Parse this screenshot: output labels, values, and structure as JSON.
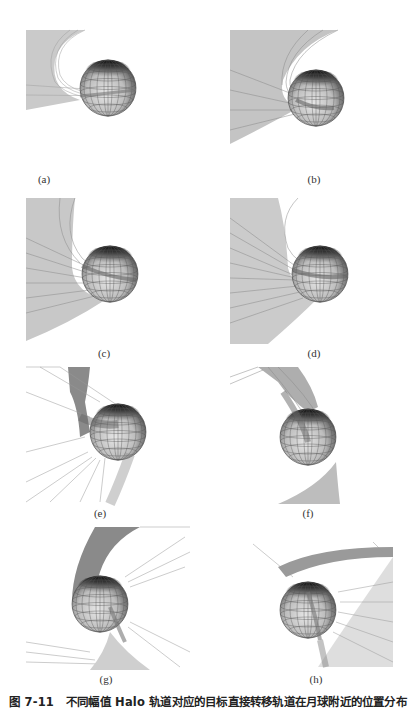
{
  "figure": {
    "number": "图 7-11",
    "title": "不同幅值 Halo 轨道对应的目标直接转移轨道在月球附近的位置分布",
    "panels": [
      {
        "id": "a",
        "label": "(a)"
      },
      {
        "id": "b",
        "label": "(b)"
      },
      {
        "id": "c",
        "label": "(c)"
      },
      {
        "id": "d",
        "label": "(d)"
      },
      {
        "id": "e",
        "label": "(e)"
      },
      {
        "id": "f",
        "label": "(f)"
      },
      {
        "id": "g",
        "label": "(g)"
      },
      {
        "id": "h",
        "label": "(h)"
      }
    ],
    "subject": {
      "body": "moon-sphere-wireframe",
      "trajectories": "transfer-trajectory-bundle"
    },
    "colors": {
      "background": "#ffffff",
      "trajectory": "#8a8a8a",
      "sphere_light": "#d8d8d8",
      "sphere_dark": "#2a2a2a",
      "text": "#222222"
    }
  }
}
